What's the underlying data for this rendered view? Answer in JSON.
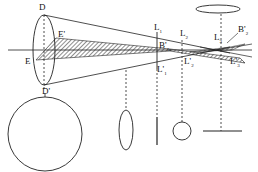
{
  "diagram": {
    "labels": {
      "D": "D",
      "D_prime": "D'",
      "E": "E",
      "E_prime": "E'",
      "L1": "L",
      "L1_sub": "1",
      "L2": "L",
      "L2_sub": "2",
      "L3": "L",
      "L3_sub": "3",
      "L1_prime": "L'",
      "L1_prime_sub": "1",
      "L2_prime": "L'",
      "L2_prime_sub": "2",
      "L3_prime": "L'",
      "L3_prime_sub": "3",
      "B1": "B'",
      "B1_sub": "1",
      "B2": "B'",
      "B2_sub": "2"
    },
    "cross_sections": [
      {
        "name": "large-circle",
        "shape": "circle"
      },
      {
        "name": "narrow-ellipse",
        "shape": "ellipse"
      },
      {
        "name": "vertical-line",
        "shape": "line"
      },
      {
        "name": "small-circle",
        "shape": "circle"
      },
      {
        "name": "horizontal-line",
        "shape": "line"
      },
      {
        "name": "flat-ellipse",
        "shape": "ellipse"
      }
    ],
    "colors": {
      "stroke": "#222222",
      "background": "#ffffff"
    }
  }
}
